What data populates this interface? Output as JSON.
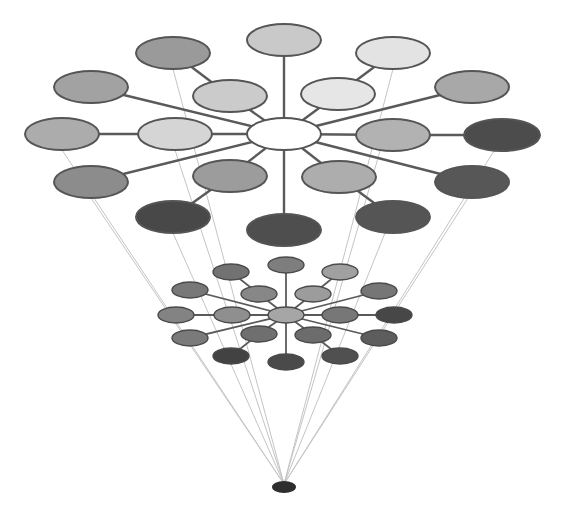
{
  "diagram": {
    "title": "",
    "colors": {
      "background": "#ffffff",
      "edge": "#5a5a5a",
      "guide": "#c4c4c4",
      "stroke": "#555555"
    },
    "top_cluster": {
      "hub": {
        "id": "t-hub",
        "cx": 284,
        "cy": 134,
        "rx": 37,
        "ry": 16,
        "fill": "#ffffff"
      },
      "nodes": [
        {
          "id": "t-top",
          "cx": 284,
          "cy": 40,
          "rx": 37,
          "ry": 16,
          "fill": "#c9c9c9",
          "parent": "t-hub"
        },
        {
          "id": "t-inner-ul",
          "cx": 230,
          "cy": 96,
          "rx": 37,
          "ry": 16,
          "fill": "#cbcbcb",
          "parent": "t-hub"
        },
        {
          "id": "t-outer-ul",
          "cx": 173,
          "cy": 53,
          "rx": 37,
          "ry": 16,
          "fill": "#9a9a9a",
          "parent": "t-inner-ul"
        },
        {
          "id": "t-inner-ur",
          "cx": 338,
          "cy": 94,
          "rx": 37,
          "ry": 16,
          "fill": "#e6e6e6",
          "parent": "t-hub"
        },
        {
          "id": "t-outer-ur",
          "cx": 393,
          "cy": 53,
          "rx": 37,
          "ry": 16,
          "fill": "#e3e3e3",
          "parent": "t-inner-ur"
        },
        {
          "id": "t-far-ul",
          "cx": 91,
          "cy": 87,
          "rx": 37,
          "ry": 16,
          "fill": "#a2a2a2",
          "parent": "t-hub"
        },
        {
          "id": "t-far-ur",
          "cx": 472,
          "cy": 87,
          "rx": 37,
          "ry": 16,
          "fill": "#a8a8a8",
          "parent": "t-hub"
        },
        {
          "id": "t-inner-l",
          "cx": 175,
          "cy": 134,
          "rx": 37,
          "ry": 16,
          "fill": "#d5d5d5",
          "parent": "t-hub"
        },
        {
          "id": "t-far-l",
          "cx": 62,
          "cy": 134,
          "rx": 37,
          "ry": 16,
          "fill": "#acacac",
          "parent": "t-inner-l"
        },
        {
          "id": "t-inner-r",
          "cx": 393,
          "cy": 135,
          "rx": 37,
          "ry": 16,
          "fill": "#b2b2b2",
          "parent": "t-hub"
        },
        {
          "id": "t-far-r",
          "cx": 502,
          "cy": 135,
          "rx": 38,
          "ry": 16,
          "fill": "#4c4c4c",
          "parent": "t-inner-r"
        },
        {
          "id": "t-far-ll",
          "cx": 91,
          "cy": 182,
          "rx": 37,
          "ry": 16,
          "fill": "#8c8c8c",
          "parent": "t-hub"
        },
        {
          "id": "t-far-lr",
          "cx": 472,
          "cy": 182,
          "rx": 37,
          "ry": 16,
          "fill": "#575757",
          "parent": "t-hub"
        },
        {
          "id": "t-inner-ll",
          "cx": 230,
          "cy": 176,
          "rx": 37,
          "ry": 16,
          "fill": "#9c9c9c",
          "parent": "t-hub"
        },
        {
          "id": "t-outer-ll",
          "cx": 173,
          "cy": 217,
          "rx": 37,
          "ry": 16,
          "fill": "#484848",
          "parent": "t-inner-ll"
        },
        {
          "id": "t-inner-lr",
          "cx": 339,
          "cy": 177,
          "rx": 37,
          "ry": 16,
          "fill": "#adadad",
          "parent": "t-hub"
        },
        {
          "id": "t-outer-lr",
          "cx": 393,
          "cy": 217,
          "rx": 37,
          "ry": 16,
          "fill": "#555555",
          "parent": "t-inner-lr"
        },
        {
          "id": "t-bottom",
          "cx": 284,
          "cy": 230,
          "rx": 37,
          "ry": 16,
          "fill": "#4e4e4e",
          "parent": "t-hub"
        }
      ]
    },
    "small_cluster": {
      "hub": {
        "id": "s-hub",
        "cx": 286,
        "cy": 315,
        "rx": 18,
        "ry": 8,
        "fill": "#a6a6a6"
      },
      "nodes": [
        {
          "id": "s-top",
          "cx": 286,
          "cy": 265,
          "rx": 18,
          "ry": 8,
          "fill": "#7e7e7e",
          "parent": "s-hub"
        },
        {
          "id": "s-inner-ul",
          "cx": 259,
          "cy": 294,
          "rx": 18,
          "ry": 8,
          "fill": "#878787",
          "parent": "s-hub"
        },
        {
          "id": "s-outer-ul",
          "cx": 231,
          "cy": 272,
          "rx": 18,
          "ry": 8,
          "fill": "#727272",
          "parent": "s-inner-ul"
        },
        {
          "id": "s-inner-ur",
          "cx": 313,
          "cy": 294,
          "rx": 18,
          "ry": 8,
          "fill": "#9c9c9c",
          "parent": "s-hub"
        },
        {
          "id": "s-outer-ur",
          "cx": 340,
          "cy": 272,
          "rx": 18,
          "ry": 8,
          "fill": "#a0a0a0",
          "parent": "s-inner-ur"
        },
        {
          "id": "s-far-ul",
          "cx": 190,
          "cy": 290,
          "rx": 18,
          "ry": 8,
          "fill": "#787878",
          "parent": "s-hub"
        },
        {
          "id": "s-far-ur",
          "cx": 379,
          "cy": 291,
          "rx": 18,
          "ry": 8,
          "fill": "#767676",
          "parent": "s-hub"
        },
        {
          "id": "s-inner-l",
          "cx": 232,
          "cy": 315,
          "rx": 18,
          "ry": 8,
          "fill": "#8f8f8f",
          "parent": "s-hub"
        },
        {
          "id": "s-far-l",
          "cx": 176,
          "cy": 315,
          "rx": 18,
          "ry": 8,
          "fill": "#838383",
          "parent": "s-inner-l"
        },
        {
          "id": "s-inner-r",
          "cx": 340,
          "cy": 315,
          "rx": 18,
          "ry": 8,
          "fill": "#777777",
          "parent": "s-hub"
        },
        {
          "id": "s-far-r",
          "cx": 394,
          "cy": 315,
          "rx": 18,
          "ry": 8,
          "fill": "#474747",
          "parent": "s-inner-r"
        },
        {
          "id": "s-far-ll",
          "cx": 190,
          "cy": 338,
          "rx": 18,
          "ry": 8,
          "fill": "#7a7a7a",
          "parent": "s-hub"
        },
        {
          "id": "s-far-lr",
          "cx": 379,
          "cy": 338,
          "rx": 18,
          "ry": 8,
          "fill": "#5d5d5d",
          "parent": "s-hub"
        },
        {
          "id": "s-inner-ll",
          "cx": 259,
          "cy": 334,
          "rx": 18,
          "ry": 8,
          "fill": "#6f6f6f",
          "parent": "s-hub"
        },
        {
          "id": "s-outer-ll",
          "cx": 231,
          "cy": 356,
          "rx": 18,
          "ry": 8,
          "fill": "#424242",
          "parent": "s-inner-ll"
        },
        {
          "id": "s-inner-lr",
          "cx": 313,
          "cy": 335,
          "rx": 18,
          "ry": 8,
          "fill": "#6c6c6c",
          "parent": "s-hub"
        },
        {
          "id": "s-outer-lr",
          "cx": 340,
          "cy": 356,
          "rx": 18,
          "ry": 8,
          "fill": "#505050",
          "parent": "s-inner-lr"
        },
        {
          "id": "s-bottom",
          "cx": 286,
          "cy": 362,
          "rx": 18,
          "ry": 8,
          "fill": "#4a4a4a",
          "parent": "s-hub"
        }
      ]
    },
    "vanishing_point": {
      "id": "apex",
      "cx": 284,
      "cy": 487,
      "rx": 12,
      "ry": 6,
      "fill": "#2e2e2e"
    },
    "guide_lines": [
      {
        "from": [
          62,
          150
        ]
      },
      {
        "from": [
          91,
          198
        ]
      },
      {
        "from": [
          173,
          69
        ]
      },
      {
        "from": [
          175,
          150
        ]
      },
      {
        "from": [
          173,
          233
        ]
      },
      {
        "from": [
          393,
          69
        ]
      },
      {
        "from": [
          380,
          151
        ]
      },
      {
        "from": [
          494,
          151
        ]
      },
      {
        "from": [
          468,
          198
        ]
      },
      {
        "from": [
          385,
          233
        ]
      }
    ]
  }
}
